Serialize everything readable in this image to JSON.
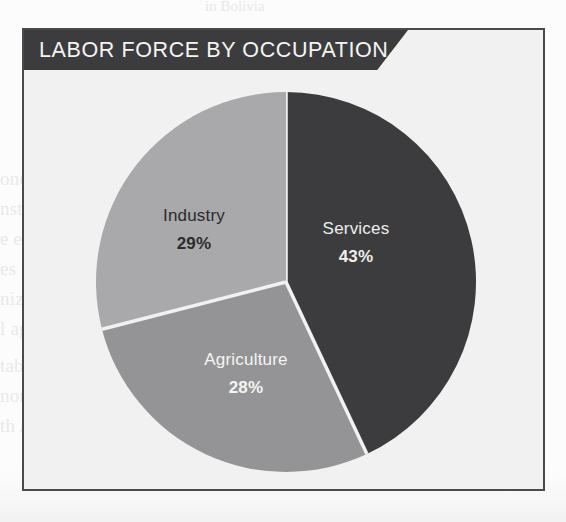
{
  "card": {
    "title": "LABOR FORCE BY OCCUPATION",
    "border_color": "#4a4a4c",
    "background_color": "#f1f1f1",
    "banner_color": "#3c3c3e",
    "banner_text_color": "#f4f4f4"
  },
  "page_background": {
    "ghost_lines": [
      "in Bolivia",
      "Economy of Bolivia",
      "onomic relations with the",
      "nstitution, and the",
      "e economic",
      "es of economic",
      "nization of",
      "l agreements",
      "table national",
      "nomic integration of",
      "th America."
    ]
  },
  "chart_data": {
    "type": "pie",
    "title": "LABOR FORCE BY OCCUPATION",
    "unit": "%",
    "start_angle_deg": 0,
    "direction": "clockwise",
    "legend": "inside-slices",
    "categories": [
      "Services",
      "Agriculture",
      "Industry"
    ],
    "values": [
      43,
      28,
      29
    ],
    "colors": [
      "#3c3c3e",
      "#949496",
      "#a9a9ab"
    ],
    "label_colors": [
      "#eeeeee",
      "#f4f4f4",
      "#2b2b2b"
    ],
    "divider_color": "#f1f1f1",
    "slices": [
      {
        "name": "Services",
        "label": "Services",
        "value_label": "43%",
        "value": 43,
        "color": "#3c3c3e",
        "text_color": "#eeeeee",
        "label_x": 268,
        "label_y": 150,
        "value_x": 268,
        "value_y": 178
      },
      {
        "name": "Agriculture",
        "label": "Agriculture",
        "value_label": "28%",
        "value": 28,
        "color": "#949496",
        "text_color": "#f4f4f4",
        "label_x": 158,
        "label_y": 281,
        "value_x": 158,
        "value_y": 309
      },
      {
        "name": "Industry",
        "label": "Industry",
        "value_label": "29%",
        "value": 29,
        "color": "#a9a9ab",
        "text_color": "#2b2b2b",
        "label_x": 106,
        "label_y": 137,
        "value_x": 106,
        "value_y": 165
      }
    ]
  }
}
